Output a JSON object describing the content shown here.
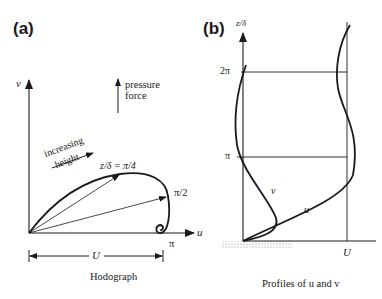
{
  "panel_a": {
    "label": "(a)",
    "v_axis_label": "v",
    "u_axis_label": "u",
    "pressure_label_line1": "pressure",
    "pressure_label_line2": "force",
    "increasing_line1": "increasing",
    "increasing_line2": "height",
    "pi4_label": "z/δ = π/4",
    "pi2_label": "π/2",
    "pi_label": "π",
    "U_label": "U",
    "caption": "Hodograph"
  },
  "panel_b": {
    "label": "(b)",
    "z_axis_label": "z/δ",
    "tick_2pi": "2π",
    "tick_pi": "π",
    "v_curve_label": "v",
    "u_curve_label": "u",
    "U_label": "U",
    "caption": "Profiles of u and v"
  },
  "colors": {
    "ink": "#1a1a1a",
    "background": "#ffffff",
    "ground_hatch": "#9a9a9a"
  }
}
